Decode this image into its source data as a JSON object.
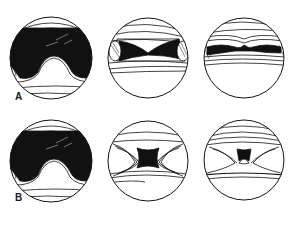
{
  "figure": {
    "background": "#ffffff",
    "ink_color": "#141414",
    "rows": [
      {
        "label": "A",
        "panels": [
          {
            "id": "A1",
            "view": "wide-dark-cavity",
            "description": "Large dark space with central rounded prominence below"
          },
          {
            "id": "A2",
            "view": "hourglass-cavity",
            "description": "Narrowed bow-tie shaped dark space"
          },
          {
            "id": "A3",
            "view": "narrow-slit-cavity",
            "description": "Thin dark slit with converging lines"
          }
        ]
      },
      {
        "label": "B",
        "panels": [
          {
            "id": "B1",
            "view": "wide-dark-cavity",
            "description": "Large dark space with central rounded prominence below"
          },
          {
            "id": "B2",
            "view": "constricted-cavity",
            "description": "Small dark central opening with folded walls"
          },
          {
            "id": "B3",
            "view": "pinpoint-cavity",
            "description": "Tiny dark opening with central peak"
          }
        ]
      }
    ]
  }
}
